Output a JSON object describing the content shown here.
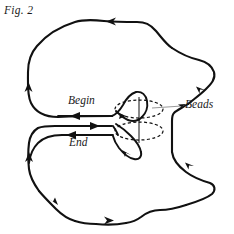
{
  "figure": {
    "caption": "Fig. 2",
    "title": "Fig. 2",
    "background_color": "#ffffff",
    "ink_color": "#111111",
    "leader_color": "#8d8d8d",
    "width": 234,
    "height": 234
  },
  "labels": {
    "begin": "Begin",
    "end": "End",
    "beads": "Beads"
  },
  "annotations": {
    "leader_line_name": "beads-leader-line",
    "bead_count": 2,
    "bead_style": "dashed-ellipse",
    "arrow_count": 10
  },
  "icons": {
    "arrow": "arrowhead-icon",
    "bead": "bead-ellipse-icon",
    "leader": "leader-line-icon"
  }
}
